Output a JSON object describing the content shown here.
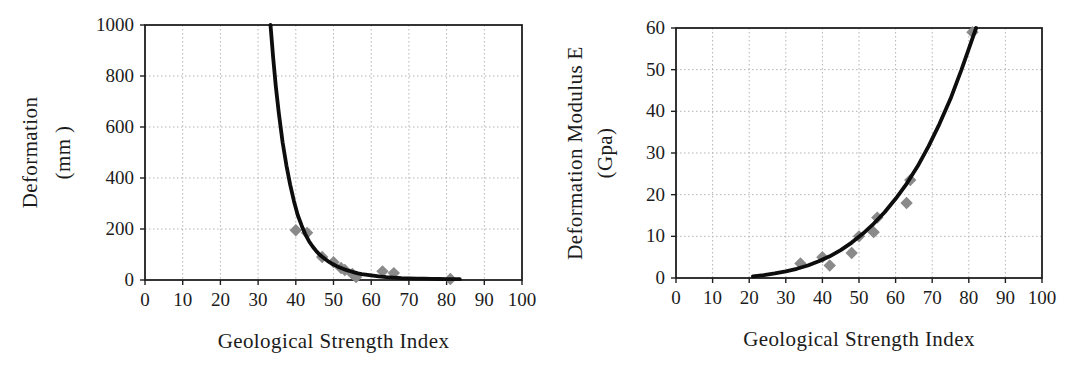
{
  "figure": {
    "background": "#ffffff",
    "description_colors": {
      "curve": "#0d0d0d",
      "marker": "#8a8a8a",
      "grid": "#b4b4b4",
      "axis": "#1f1f1f",
      "text": "#1c1c1c"
    }
  },
  "chart_data": [
    {
      "type": "scatter",
      "title": "",
      "xlabel": "Geological Strength Index",
      "ylabel_lines": [
        "Deformation",
        "(mm )"
      ],
      "xlim": [
        0,
        100
      ],
      "ylim": [
        0,
        1000
      ],
      "xticks": [
        0,
        10,
        20,
        30,
        40,
        50,
        60,
        70,
        80,
        90,
        100
      ],
      "yticks": [
        0,
        200,
        400,
        600,
        800,
        1000
      ],
      "grid": true,
      "legend": "none",
      "series": [
        {
          "name": "field-data-points",
          "kind": "scatter",
          "marker": "diamond",
          "color": "#8a8a8a",
          "points": [
            [
              40,
              195
            ],
            [
              43,
              185
            ],
            [
              47,
              90
            ],
            [
              50,
              70
            ],
            [
              52,
              47
            ],
            [
              53,
              39
            ],
            [
              55,
              24
            ],
            [
              56,
              12
            ],
            [
              63,
              34
            ],
            [
              66,
              27
            ],
            [
              81,
              4
            ]
          ]
        },
        {
          "name": "trend-curve",
          "kind": "line",
          "color": "#0d0d0d",
          "width": 3.8,
          "points": [
            [
              33.3,
              1000
            ],
            [
              34,
              870
            ],
            [
              34.7,
              760
            ],
            [
              35.5,
              655
            ],
            [
              36.5,
              540
            ],
            [
              37.5,
              450
            ],
            [
              38.5,
              375
            ],
            [
              39.5,
              310
            ],
            [
              40.5,
              255
            ],
            [
              41.5,
              215
            ],
            [
              42.5,
              180
            ],
            [
              43.5,
              152
            ],
            [
              44.5,
              130
            ],
            [
              45.5,
              112
            ],
            [
              46.5,
              97
            ],
            [
              47.5,
              85
            ],
            [
              48.5,
              74
            ],
            [
              49.5,
              65
            ],
            [
              50.5,
              57
            ],
            [
              51.5,
              50
            ],
            [
              52.5,
              44
            ],
            [
              53.5,
              39
            ],
            [
              54.5,
              34
            ],
            [
              55.5,
              30
            ],
            [
              56.5,
              26
            ],
            [
              57.5,
              23
            ],
            [
              58.5,
              21
            ],
            [
              60,
              18
            ],
            [
              62,
              14
            ],
            [
              64,
              11
            ],
            [
              66,
              9
            ],
            [
              68,
              7.5
            ],
            [
              70,
              6.5
            ],
            [
              72,
              5.5
            ],
            [
              74,
              5
            ],
            [
              76,
              4.5
            ],
            [
              78,
              4
            ],
            [
              80,
              3.5
            ],
            [
              82,
              3
            ],
            [
              83.5,
              3
            ]
          ]
        }
      ]
    },
    {
      "type": "scatter",
      "title": "",
      "xlabel": "Geological Strength Index",
      "ylabel_lines": [
        "Deformation Modulus E",
        "(Gpa)"
      ],
      "xlim": [
        0,
        100
      ],
      "ylim": [
        0,
        60
      ],
      "xticks": [
        0,
        10,
        20,
        30,
        40,
        50,
        60,
        70,
        80,
        90,
        100
      ],
      "yticks": [
        0,
        10,
        20,
        30,
        40,
        50,
        60
      ],
      "grid": true,
      "legend": "none",
      "series": [
        {
          "name": "field-data-points",
          "kind": "scatter",
          "marker": "diamond",
          "color": "#8a8a8a",
          "points": [
            [
              34,
              3.5
            ],
            [
              40,
              5
            ],
            [
              42,
              3
            ],
            [
              48,
              6
            ],
            [
              50,
              10
            ],
            [
              54,
              11
            ],
            [
              55,
              14.5
            ],
            [
              63,
              18
            ],
            [
              64,
              23.5
            ],
            [
              81,
              59
            ]
          ]
        },
        {
          "name": "trend-curve",
          "kind": "line",
          "color": "#0d0d0d",
          "width": 3.8,
          "points": [
            [
              21,
              0.4
            ],
            [
              24,
              0.7
            ],
            [
              27,
              1.1
            ],
            [
              30,
              1.6
            ],
            [
              33,
              2.2
            ],
            [
              36,
              3
            ],
            [
              39,
              4
            ],
            [
              42,
              5.2
            ],
            [
              45,
              6.7
            ],
            [
              48,
              8.5
            ],
            [
              51,
              10.6
            ],
            [
              54,
              13
            ],
            [
              57,
              15.8
            ],
            [
              60,
              19
            ],
            [
              63,
              22.6
            ],
            [
              66,
              26.8
            ],
            [
              69,
              31.6
            ],
            [
              72,
              37
            ],
            [
              75,
              43
            ],
            [
              78,
              50
            ],
            [
              80,
              55
            ],
            [
              82,
              60
            ]
          ]
        }
      ]
    }
  ]
}
